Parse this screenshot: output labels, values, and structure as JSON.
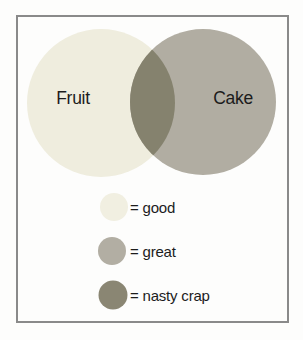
{
  "venn": {
    "sets": [
      {
        "label": "Fruit",
        "color": "#efedde"
      },
      {
        "label": "Cake",
        "color": "#b1ada2"
      }
    ],
    "intersection_color": "#85826e"
  },
  "legend": {
    "items": [
      {
        "label": "= good",
        "color": "#f1efe1"
      },
      {
        "label": "= great",
        "color": "#b2aea3"
      },
      {
        "label": "= nasty crap",
        "color": "#8a8673"
      }
    ]
  },
  "frame": {
    "border_color": "#8a8a8a"
  }
}
